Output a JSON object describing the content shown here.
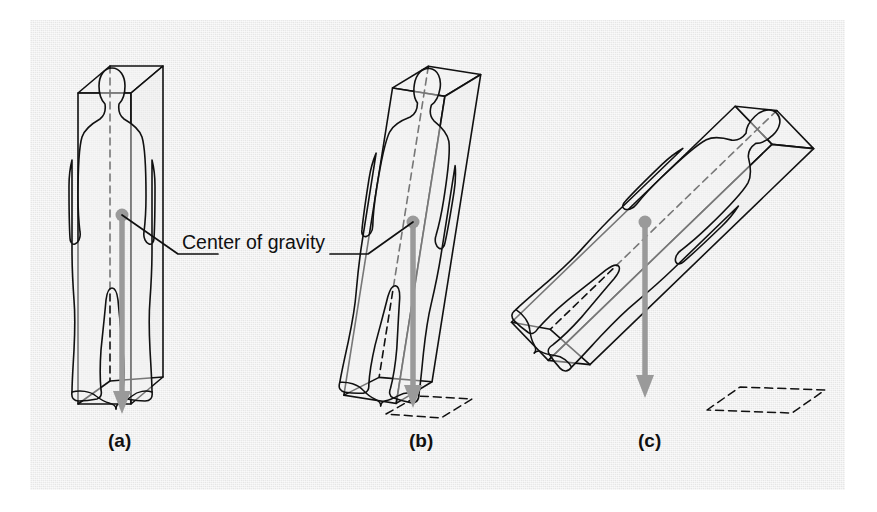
{
  "figure": {
    "background_color": "#e9e9e9",
    "page_color": "#ffffff",
    "line_color": "#111111",
    "gravity_color": "#9a9a9a",
    "annotation": {
      "text": "Center of gravity",
      "x": 182,
      "y": 244
    },
    "panels": [
      {
        "id": "a",
        "label": "(a)",
        "label_x": 108,
        "label_y": 443,
        "description": "Upright standing person inside an upright rectangular box; line of gravity falls within the base of support",
        "cog_dot": {
          "x": 122,
          "y": 215,
          "r": 6
        },
        "gravity_arrow": {
          "x1": 122,
          "y1": 215,
          "x2": 122,
          "y2": 412
        },
        "tilt_deg": 0,
        "base_dashed": false
      },
      {
        "id": "b",
        "label": "(b)",
        "label_x": 409,
        "label_y": 443,
        "description": "Slightly tilted person and box; line of gravity still falls within the base of support",
        "cog_dot": {
          "x": 413,
          "y": 222,
          "r": 6
        },
        "gravity_arrow": {
          "x1": 413,
          "y1": 222,
          "x2": 413,
          "y2": 406
        },
        "tilt_deg": 9,
        "base_dashed": true
      },
      {
        "id": "c",
        "label": "(c)",
        "label_x": 638,
        "label_y": 443,
        "description": "Strongly tilted person and box; line of gravity falls outside the dashed base of support",
        "cog_dot": {
          "x": 645,
          "y": 222,
          "r": 6
        },
        "gravity_arrow": {
          "x1": 645,
          "y1": 222,
          "x2": 645,
          "y2": 398
        },
        "tilt_deg": 46,
        "base_dashed": true
      }
    ],
    "leader_lines": [
      {
        "name": "leader-left",
        "points": "122,215 178,254 218,254"
      },
      {
        "name": "leader-right",
        "points": "413,222 368,254 330,254"
      }
    ]
  }
}
